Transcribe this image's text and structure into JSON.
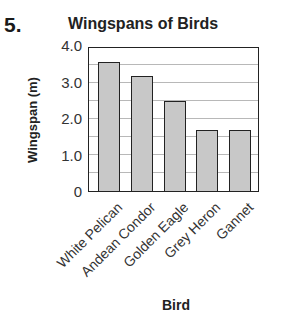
{
  "question_number": "5.",
  "chart_data": {
    "type": "bar",
    "title": "Wingspans of Birds",
    "xlabel": "Bird",
    "ylabel": "Wingspan (m)",
    "categories": [
      "White Pelican",
      "Andean Condor",
      "Golden Eagle",
      "Grey Heron",
      "Gannet"
    ],
    "values": [
      3.6,
      3.2,
      2.5,
      1.7,
      1.7
    ],
    "ylim": [
      0,
      4.0
    ],
    "yticks": [
      "0",
      "1.0",
      "2.0",
      "3.0",
      "4.0"
    ],
    "gridlines": [
      0.5,
      1.0,
      1.5,
      2.0,
      2.5,
      3.0,
      3.5
    ],
    "grid": true,
    "legend": null,
    "bar_color": "#c8c8c8",
    "border_color": "#222222"
  }
}
